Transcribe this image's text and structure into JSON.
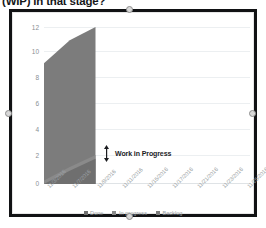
{
  "document": {
    "heading_clipped": "(WIP) in that stage?"
  },
  "picture": {
    "selection_handles": [
      "top",
      "bottom",
      "left",
      "right"
    ]
  },
  "annotation": {
    "label": "Work in Progress",
    "icon": "double-arrow-vertical-icon"
  },
  "chart_data": {
    "type": "area",
    "title": "",
    "xlabel": "",
    "ylabel": "",
    "ylim": [
      0,
      13
    ],
    "yticks": [
      0,
      2,
      4,
      6,
      8,
      10,
      12
    ],
    "grid": true,
    "legend_position": "bottom",
    "stacked": true,
    "categories": [
      "11/3/2016",
      "11/7/2016",
      "11/9/2016",
      "11/11/2016",
      "11/15/2016",
      "11/17/2016",
      "11/21/2016",
      "11/23/2016",
      "11/25/2016"
    ],
    "series": [
      {
        "name": "Done",
        "color": "#6f6f6f",
        "values": [
          0.0,
          1.1,
          2.1,
          null,
          null,
          null,
          null,
          null,
          null
        ]
      },
      {
        "name": "In progress",
        "color": "#8a8a8a",
        "values": [
          0.3,
          1.4,
          2.4,
          null,
          null,
          null,
          null,
          null,
          null
        ]
      },
      {
        "name": "Backlog",
        "color": "#7c7c7c",
        "values": [
          10.0,
          11.9,
          13.0,
          null,
          null,
          null,
          null,
          null,
          null
        ]
      }
    ]
  },
  "legend": {
    "items": [
      {
        "label": "Done",
        "color": "#6f6f6f"
      },
      {
        "label": "In progress",
        "color": "#8a8a8a"
      },
      {
        "label": "Backlog",
        "color": "#7c7c7c"
      }
    ]
  }
}
